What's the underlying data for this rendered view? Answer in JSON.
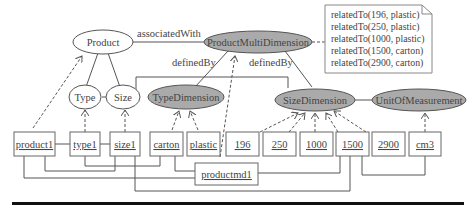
{
  "diagram": {
    "classes": {
      "product": "Product",
      "type": "Type",
      "size": "Size",
      "product_multi_dimension": "ProductMultiDimension",
      "type_dimension": "TypeDimension",
      "size_dimension": "SizeDimension",
      "unit_of_measurement": "UnitOfMeasurement"
    },
    "edge_labels": {
      "associated_with": "associatedWith",
      "defined_by_1": "definedBy",
      "defined_by_2": "definedBy"
    },
    "instances": {
      "product1": "product1",
      "type1": "type1",
      "size1": "size1",
      "carton": "carton",
      "plastic": "plastic",
      "v196": "196",
      "v250": "250",
      "v1000": "1000",
      "v1500": "1500",
      "v2900": "2900",
      "cm3": "cm3",
      "productmd1": "productmd1"
    },
    "note": {
      "lines": [
        "relatedTo(196, plastic)",
        "relatedTo(250, plastic)",
        "relatedTo(1000, plastic)",
        "relatedTo(1500, carton)",
        "relatedTo(2900, carton)"
      ]
    },
    "colors": {
      "dimension_fill": "#aaaaaa",
      "line": "#555555"
    }
  }
}
